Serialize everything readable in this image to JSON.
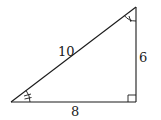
{
  "diagram": {
    "type": "right-triangle",
    "labels": {
      "hypotenuse": "10",
      "vertical_side": "6",
      "horizontal_side": "8"
    },
    "markers": {
      "right_angle": "bottom-right",
      "angle_bottom_left": "double-tick arc",
      "angle_top_right": "single-tick arc"
    },
    "colors": {
      "stroke": "#1a1a1a",
      "background": "#ffffff"
    }
  }
}
